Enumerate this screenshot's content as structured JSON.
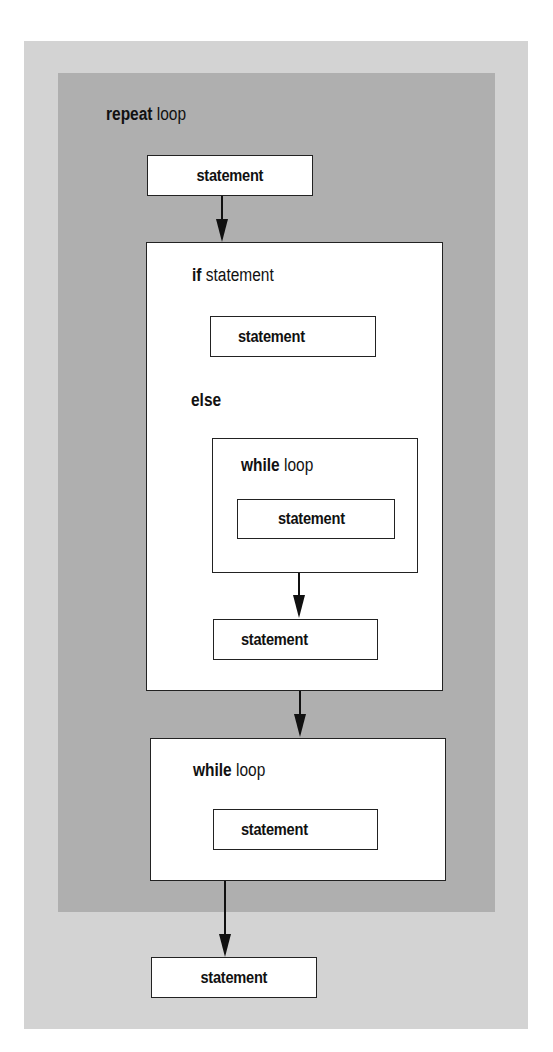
{
  "diagram": {
    "title_keyword": "repeat",
    "title_rest": "loop",
    "statements": {
      "top": "statement",
      "if_body": "statement",
      "while_inner_body": "statement",
      "after_while": "statement",
      "while_outer_body": "statement",
      "bottom": "statement"
    },
    "if_block": {
      "keyword": "if",
      "rest": "statement",
      "else_label": "else"
    },
    "inner_while": {
      "keyword": "while",
      "rest": "loop"
    },
    "outer_while": {
      "keyword": "while",
      "rest": "loop"
    }
  },
  "colors": {
    "outer_panel": "#d3d3d3",
    "inner_panel": "#afafaf",
    "box_fill": "#ffffff",
    "stroke": "#111111"
  }
}
